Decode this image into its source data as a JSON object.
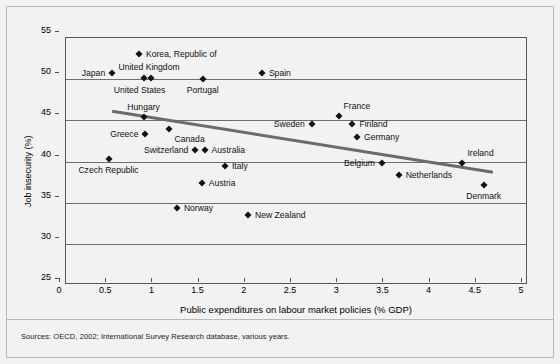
{
  "figure": {
    "sources_note": "Sources: OECD, 2002; International Survey Research database, various years."
  },
  "chart_data": {
    "type": "scatter",
    "title": "",
    "xlabel": "Public expenditures on labour market policies (% GDP)",
    "ylabel": "Job insecurity (%)",
    "xlim": [
      0,
      5
    ],
    "ylim": [
      25,
      55
    ],
    "xticks": [
      "0",
      "0.5",
      "1",
      "1.5",
      "2",
      "2.5",
      "3",
      "3.5",
      "4",
      "4.5",
      "5"
    ],
    "xtick_values": [
      0,
      0.5,
      1,
      1.5,
      2,
      2.5,
      3,
      3.5,
      4,
      4.5,
      5
    ],
    "yticks": [
      "25",
      "30",
      "35",
      "40",
      "45",
      "50",
      "55"
    ],
    "ytick_values": [
      25,
      30,
      35,
      40,
      45,
      50,
      55
    ],
    "grid": "horizontal",
    "legend": "none",
    "points": [
      {
        "label": "Korea, Republic of",
        "x": 0.79,
        "y": 53.0,
        "label_pos": "right"
      },
      {
        "label": "Japan",
        "x": 0.5,
        "y": 50.8,
        "label_pos": "left"
      },
      {
        "label": "United Kingdom",
        "x": 0.92,
        "y": 50.2,
        "label_pos": "uk"
      },
      {
        "label": "United States",
        "x": 0.84,
        "y": 50.2,
        "label_pos": "us"
      },
      {
        "label": "Spain",
        "x": 2.12,
        "y": 50.8,
        "label_pos": "right"
      },
      {
        "label": "Portugal",
        "x": 1.48,
        "y": 50.0,
        "label_pos": "below"
      },
      {
        "label": "Hungary",
        "x": 0.84,
        "y": 45.4,
        "label_pos": "above"
      },
      {
        "label": "France",
        "x": 2.95,
        "y": 45.5,
        "label_pos": "above-right"
      },
      {
        "label": "Sweden",
        "x": 2.66,
        "y": 44.5,
        "label_pos": "left"
      },
      {
        "label": "Finland",
        "x": 3.1,
        "y": 44.5,
        "label_pos": "right"
      },
      {
        "label": "Germany",
        "x": 3.15,
        "y": 43.0,
        "label_pos": "right"
      },
      {
        "label": "Greece",
        "x": 0.86,
        "y": 43.4,
        "label_pos": "left"
      },
      {
        "label": "Canada",
        "x": 1.11,
        "y": 44.0,
        "label_pos": "below-right"
      },
      {
        "label": "Switzerland",
        "x": 1.4,
        "y": 41.4,
        "label_pos": "left"
      },
      {
        "label": "Australia",
        "x": 1.5,
        "y": 41.4,
        "label_pos": "right"
      },
      {
        "label": "Czech Republic",
        "x": 0.46,
        "y": 40.3,
        "label_pos": "below"
      },
      {
        "label": "Italy",
        "x": 1.72,
        "y": 39.5,
        "label_pos": "right"
      },
      {
        "label": "Belgium",
        "x": 3.42,
        "y": 39.8,
        "label_pos": "left"
      },
      {
        "label": "Ireland",
        "x": 4.29,
        "y": 39.8,
        "label_pos": "above-right"
      },
      {
        "label": "Netherlands",
        "x": 3.6,
        "y": 38.4,
        "label_pos": "right"
      },
      {
        "label": "Denmark",
        "x": 4.52,
        "y": 37.2,
        "label_pos": "below"
      },
      {
        "label": "Austria",
        "x": 1.47,
        "y": 37.4,
        "label_pos": "right"
      },
      {
        "label": "Norway",
        "x": 1.2,
        "y": 34.4,
        "label_pos": "right"
      },
      {
        "label": "New Zealand",
        "x": 1.97,
        "y": 33.5,
        "label_pos": "right"
      }
    ],
    "trendline": {
      "x1": 0.5,
      "y1": 46.1,
      "x2": 4.62,
      "y2": 38.7,
      "color": "#6b6b6b"
    }
  }
}
